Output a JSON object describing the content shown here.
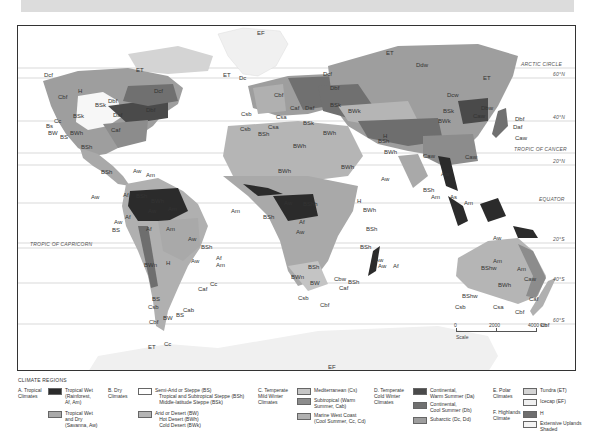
{
  "map": {
    "latitudes": [
      {
        "label": "ARCTIC CIRCLE",
        "y": 42,
        "label_x": 503
      },
      {
        "label": "60°N",
        "y": 52,
        "label_x": 535
      },
      {
        "label": "40°N",
        "y": 95,
        "label_x": 535
      },
      {
        "label": "TROPIC OF CANCER",
        "y": 127,
        "label_x": 496
      },
      {
        "label": "20°N",
        "y": 139,
        "label_x": 535
      },
      {
        "label": "EQUATOR",
        "y": 177,
        "label_x": 521
      },
      {
        "label": "20°S",
        "y": 217,
        "label_x": 535
      },
      {
        "label": "TROPIC OF CAPRICORN",
        "y": 222,
        "label_x": 12
      },
      {
        "label": "40°S",
        "y": 257,
        "label_x": 535
      },
      {
        "label": "60°S",
        "y": 298,
        "label_x": 535
      }
    ],
    "codes": [
      {
        "t": "EF",
        "x": 239,
        "y": 4
      },
      {
        "t": "ET",
        "x": 118,
        "y": 41
      },
      {
        "t": "ET",
        "x": 205,
        "y": 46
      },
      {
        "t": "Dc",
        "x": 221,
        "y": 49
      },
      {
        "t": "ET",
        "x": 368,
        "y": 24
      },
      {
        "t": "Ddw",
        "x": 398,
        "y": 36
      },
      {
        "t": "Dcf",
        "x": 26,
        "y": 46
      },
      {
        "t": "Dcf",
        "x": 305,
        "y": 45
      },
      {
        "t": "Dcf",
        "x": 136,
        "y": 62
      },
      {
        "t": "Dbf",
        "x": 312,
        "y": 59
      },
      {
        "t": "ET",
        "x": 465,
        "y": 49
      },
      {
        "t": "Cbf",
        "x": 40,
        "y": 68
      },
      {
        "t": "H",
        "x": 60,
        "y": 62
      },
      {
        "t": "BSk",
        "x": 77,
        "y": 76
      },
      {
        "t": "Dbf",
        "x": 90,
        "y": 72
      },
      {
        "t": "Dbf",
        "x": 128,
        "y": 81
      },
      {
        "t": "Daf",
        "x": 95,
        "y": 86
      },
      {
        "t": "Cbf",
        "x": 256,
        "y": 66
      },
      {
        "t": "Caf",
        "x": 272,
        "y": 79
      },
      {
        "t": "Daf",
        "x": 287,
        "y": 79
      },
      {
        "t": "BSk",
        "x": 312,
        "y": 76
      },
      {
        "t": "BWk",
        "x": 330,
        "y": 82
      },
      {
        "t": "Dcw",
        "x": 429,
        "y": 66
      },
      {
        "t": "Dbw",
        "x": 463,
        "y": 79
      },
      {
        "t": "Caw",
        "x": 455,
        "y": 87
      },
      {
        "t": "BSk",
        "x": 425,
        "y": 82
      },
      {
        "t": "BWk",
        "x": 420,
        "y": 92
      },
      {
        "t": "Dbf",
        "x": 497,
        "y": 90
      },
      {
        "t": "Daf",
        "x": 495,
        "y": 98
      },
      {
        "t": "Caw",
        "x": 497,
        "y": 109
      },
      {
        "t": "BSk",
        "x": 55,
        "y": 87
      },
      {
        "t": "Cc",
        "x": 36,
        "y": 92
      },
      {
        "t": "Bs",
        "x": 28,
        "y": 97
      },
      {
        "t": "BW",
        "x": 30,
        "y": 104
      },
      {
        "t": "BS",
        "x": 42,
        "y": 108
      },
      {
        "t": "BWh",
        "x": 52,
        "y": 104
      },
      {
        "t": "Caf",
        "x": 93,
        "y": 101
      },
      {
        "t": "Csb",
        "x": 223,
        "y": 85
      },
      {
        "t": "Csb",
        "x": 222,
        "y": 100
      },
      {
        "t": "Csa",
        "x": 250,
        "y": 98
      },
      {
        "t": "Csa",
        "x": 258,
        "y": 88
      },
      {
        "t": "BSk",
        "x": 285,
        "y": 94
      },
      {
        "t": "BSh",
        "x": 240,
        "y": 105
      },
      {
        "t": "BWh",
        "x": 305,
        "y": 104
      },
      {
        "t": "H",
        "x": 365,
        "y": 107
      },
      {
        "t": "BSh",
        "x": 360,
        "y": 112
      },
      {
        "t": "BWh",
        "x": 275,
        "y": 117
      },
      {
        "t": "BWh",
        "x": 366,
        "y": 123
      },
      {
        "t": "Caw",
        "x": 405,
        "y": 127
      },
      {
        "t": "Caw",
        "x": 447,
        "y": 128
      },
      {
        "t": "BSh",
        "x": 63,
        "y": 118
      },
      {
        "t": "BSh",
        "x": 83,
        "y": 143
      },
      {
        "t": "Aw",
        "x": 115,
        "y": 142
      },
      {
        "t": "Am",
        "x": 128,
        "y": 146
      },
      {
        "t": "Aw",
        "x": 73,
        "y": 168
      },
      {
        "t": "Af",
        "x": 105,
        "y": 166
      },
      {
        "t": "BSh",
        "x": 118,
        "y": 167
      },
      {
        "t": "BWh",
        "x": 133,
        "y": 172
      },
      {
        "t": "Aw",
        "x": 130,
        "y": 182
      },
      {
        "t": "Am",
        "x": 150,
        "y": 180
      },
      {
        "t": "Af",
        "x": 107,
        "y": 188
      },
      {
        "t": "Aw",
        "x": 96,
        "y": 193
      },
      {
        "t": "BS",
        "x": 94,
        "y": 201
      },
      {
        "t": "Af",
        "x": 128,
        "y": 200
      },
      {
        "t": "Am",
        "x": 148,
        "y": 200
      },
      {
        "t": "BWh",
        "x": 260,
        "y": 142
      },
      {
        "t": "BWh",
        "x": 323,
        "y": 138
      },
      {
        "t": "Aw",
        "x": 423,
        "y": 145
      },
      {
        "t": "BSh",
        "x": 405,
        "y": 161
      },
      {
        "t": "Am",
        "x": 413,
        "y": 168
      },
      {
        "t": "As",
        "x": 432,
        "y": 168
      },
      {
        "t": "Am",
        "x": 446,
        "y": 174
      },
      {
        "t": "Aw",
        "x": 363,
        "y": 150
      },
      {
        "t": "Am",
        "x": 213,
        "y": 182
      },
      {
        "t": "Aw",
        "x": 266,
        "y": 174
      },
      {
        "t": "BShh",
        "x": 285,
        "y": 175
      },
      {
        "t": "BSh",
        "x": 245,
        "y": 188
      },
      {
        "t": "H",
        "x": 339,
        "y": 172
      },
      {
        "t": "BWh",
        "x": 345,
        "y": 181
      },
      {
        "t": "Af",
        "x": 281,
        "y": 193
      },
      {
        "t": "Aw",
        "x": 278,
        "y": 203
      },
      {
        "t": "BSh",
        "x": 348,
        "y": 200
      },
      {
        "t": "BSh",
        "x": 342,
        "y": 218
      },
      {
        "t": "Aw",
        "x": 357,
        "y": 231
      },
      {
        "t": "Af",
        "x": 375,
        "y": 237
      },
      {
        "t": "Aw",
        "x": 360,
        "y": 237
      },
      {
        "t": "BSh",
        "x": 290,
        "y": 238
      },
      {
        "t": "BWn",
        "x": 273,
        "y": 248
      },
      {
        "t": "BW",
        "x": 292,
        "y": 254
      },
      {
        "t": "Cbw",
        "x": 316,
        "y": 250
      },
      {
        "t": "BSh",
        "x": 330,
        "y": 253
      },
      {
        "t": "Caf",
        "x": 321,
        "y": 259
      },
      {
        "t": "Csb",
        "x": 280,
        "y": 269
      },
      {
        "t": "Cbf",
        "x": 302,
        "y": 276
      },
      {
        "t": "Aw",
        "x": 170,
        "y": 210
      },
      {
        "t": "BSh",
        "x": 183,
        "y": 218
      },
      {
        "t": "Aw",
        "x": 173,
        "y": 232
      },
      {
        "t": "Af",
        "x": 198,
        "y": 229
      },
      {
        "t": "Am",
        "x": 198,
        "y": 236
      },
      {
        "t": "BWn",
        "x": 126,
        "y": 236
      },
      {
        "t": "H",
        "x": 148,
        "y": 234
      },
      {
        "t": "Cc",
        "x": 192,
        "y": 255
      },
      {
        "t": "Caf",
        "x": 180,
        "y": 260
      },
      {
        "t": "BS",
        "x": 134,
        "y": 270
      },
      {
        "t": "Csb",
        "x": 130,
        "y": 278
      },
      {
        "t": "Cab",
        "x": 165,
        "y": 281
      },
      {
        "t": "BS",
        "x": 158,
        "y": 286
      },
      {
        "t": "Cbf",
        "x": 131,
        "y": 293
      },
      {
        "t": "BW",
        "x": 145,
        "y": 289
      },
      {
        "t": "Cc",
        "x": 146,
        "y": 315
      },
      {
        "t": "Aw",
        "x": 475,
        "y": 209
      },
      {
        "t": "Am",
        "x": 475,
        "y": 232
      },
      {
        "t": "BShw",
        "x": 463,
        "y": 239
      },
      {
        "t": "Am",
        "x": 499,
        "y": 240
      },
      {
        "t": "Caw",
        "x": 506,
        "y": 250
      },
      {
        "t": "BWh",
        "x": 480,
        "y": 256
      },
      {
        "t": "BShw",
        "x": 444,
        "y": 267
      },
      {
        "t": "Csb",
        "x": 437,
        "y": 278
      },
      {
        "t": "Csa",
        "x": 475,
        "y": 278
      },
      {
        "t": "Caf",
        "x": 511,
        "y": 270
      },
      {
        "t": "Cbf",
        "x": 497,
        "y": 283
      },
      {
        "t": "Cbf",
        "x": 522,
        "y": 296
      },
      {
        "t": "ET",
        "x": 130,
        "y": 318
      },
      {
        "t": "EF",
        "x": 310,
        "y": 338
      }
    ],
    "scale": {
      "ticks": [
        "0",
        "2000",
        "4000 km"
      ],
      "label": "Scale"
    }
  },
  "legend": {
    "title": "CLIMATE REGIONS",
    "groups": [
      {
        "label": "A. Tropical\nClimates",
        "x": 0,
        "y": 10,
        "items": [
          {
            "label": "Tropical Wet\n(Rainforest,\nAf, Am)",
            "color": "#2b2b2b",
            "x": 30,
            "y": 10
          },
          {
            "label": "Tropical Wet\nand Dry\n(Savanna, Aw)",
            "color": "#a9a9a9",
            "x": 30,
            "y": 33
          }
        ]
      },
      {
        "label": "B. Dry\nClimates",
        "x": 90,
        "y": 10,
        "items": [
          {
            "label": "Semi-Arid or Steppe (BS)\n   Tropical and Subtropical Steppe (BSh)\n   Middle-latitude Steppe (BSk)",
            "color": "#ffffff",
            "x": 120,
            "y": 10
          },
          {
            "label": "Arid or Desert (BW)\n   Hot Desert (BWh)\n   Cold Desert (BWk)",
            "color": "#b5b5b5",
            "x": 120,
            "y": 33
          }
        ]
      },
      {
        "label": "C. Temperate\nMild Winter\nClimates",
        "x": 240,
        "y": 10,
        "items": [
          {
            "label": "Mediterranean (Cs)",
            "color": "#c4c4c4",
            "x": 279,
            "y": 10
          },
          {
            "label": "Subtropical (Warm\nSummer, Cab)",
            "color": "#8c8c8c",
            "x": 279,
            "y": 20
          },
          {
            "label": "Marine West Coast\n(Cool Summer, Cc, Cd)",
            "color": "#b0b0b0",
            "x": 279,
            "y": 35
          }
        ]
      },
      {
        "label": "D. Temperate\nCold Winter\nClimates",
        "x": 356,
        "y": 10,
        "items": [
          {
            "label": "Continental,\nWarm Summer (Da)",
            "color": "#4a4a4a",
            "x": 395,
            "y": 10
          },
          {
            "label": "Continental,\nCool Summer (Db)",
            "color": "#707070",
            "x": 395,
            "y": 24
          },
          {
            "label": "Subarctic (Dc, Dd)",
            "color": "#9e9e9e",
            "x": 395,
            "y": 39
          }
        ]
      },
      {
        "label": "E. Polar\nClimates",
        "x": 475,
        "y": 10,
        "items": [
          {
            "label": "Tundra (ET)",
            "color": "#d4d4d4",
            "x": 505,
            "y": 10
          },
          {
            "label": "Icecap (EF)",
            "color": "#f0f0f0",
            "x": 505,
            "y": 21
          }
        ]
      },
      {
        "label": "F. Highlands\nClimate",
        "x": 475,
        "y": 32,
        "items": [
          {
            "label": "H",
            "color": "#6e6e6e",
            "x": 505,
            "y": 33
          },
          {
            "label": "Extensive Uplands\nShaded",
            "color": "#f4f4f4",
            "x": 505,
            "y": 43
          }
        ]
      }
    ]
  }
}
